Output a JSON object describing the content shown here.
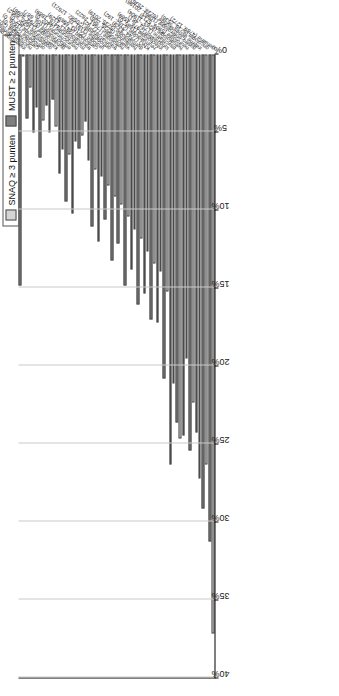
{
  "chart_data": {
    "type": "bar",
    "orientation": "horizontal",
    "title": "",
    "xlabel": "",
    "ylabel": "",
    "xlim": [
      0,
      40
    ],
    "xunit": "%",
    "xticks": [
      "0%",
      "5%",
      "10%",
      "15%",
      "20%",
      "25%",
      "30%",
      "35%",
      "40%"
    ],
    "xtick_values": [
      0,
      5,
      10,
      15,
      20,
      25,
      30,
      35,
      40
    ],
    "x_axis_reversed": true,
    "grid": true,
    "legend_position": "top-left",
    "categories": [
      "inwendige geneeskunde (447, 982)",
      "nucleaire geneeskunde (5909, 1889)",
      "cardiochirurgie (2017, 182)",
      "orthopedie (2536, 0)",
      "oogheelkunde (1506, 0)",
      "kaakchirurgie (2452, 0)",
      "gynaecologie (13960, 8952)",
      "endocrinologie (6794, 4098)",
      "neurochirurgie (1106, 887)",
      "mondchirurgie (4402, 0)",
      "traumatologie (4476, 1889)",
      "cardiologie (4472, 4329)",
      "urologie (22103, 6969)",
      "orthopedie (3191, 0)",
      "traumachirurgie (20582, 12621)",
      "nefrologie (777, 92)",
      "vaatchirurgie (7961, 2822)",
      "heelkunde (5235, 206)",
      "dermatologie (5235, 2019)",
      "KNO (7244, 4329)",
      "reumatologie (2182, 192)",
      "infectiologie (1685, 0)",
      "longziekten (2976, 4569)",
      "psychiatrie (1734, 481)",
      "hematologie (8263, 11904)",
      "neurologie (5909, 5213)",
      "gastro-enterologie (10961, 20196)",
      "interne geneeskunde (6238, 2536)",
      "oncologie (6238, 2536)",
      "geriatrie (4789, 1272)"
    ],
    "series": [
      {
        "name": "SNAQ ≥ 3 punten",
        "color": "#d4d4d4",
        "values": [
          0.0,
          2.1,
          3.4,
          4.2,
          5.0,
          4.6,
          6.1,
          6.4,
          5.6,
          5.2,
          6.8,
          7.4,
          7.8,
          8.4,
          9.1,
          9.6,
          10.4,
          11.2,
          11.8,
          12.6,
          13.4,
          13.9,
          15.2,
          21.1,
          24.6,
          19.5,
          22.3,
          27.2,
          26.3,
          37.1
        ]
      },
      {
        "name": "MUST ≥ 2 punten",
        "color": "#7f7f7f",
        "values": [
          14.8,
          4.1,
          5.0,
          6.6,
          3.3,
          2.9,
          7.6,
          9.4,
          10.2,
          6.0,
          4.3,
          11.0,
          12.0,
          10.6,
          13.2,
          12.1,
          14.8,
          13.8,
          16.0,
          15.3,
          17.0,
          17.2,
          20.8,
          26.3,
          23.6,
          24.4,
          25.4,
          24.2,
          29.1,
          31.2
        ]
      }
    ]
  },
  "legend": {
    "items": [
      {
        "label": "SNAQ ≥ 3 punten",
        "color": "#d4d4d4"
      },
      {
        "label": "MUST ≥ 2 punten",
        "color": "#7f7f7f"
      }
    ]
  }
}
